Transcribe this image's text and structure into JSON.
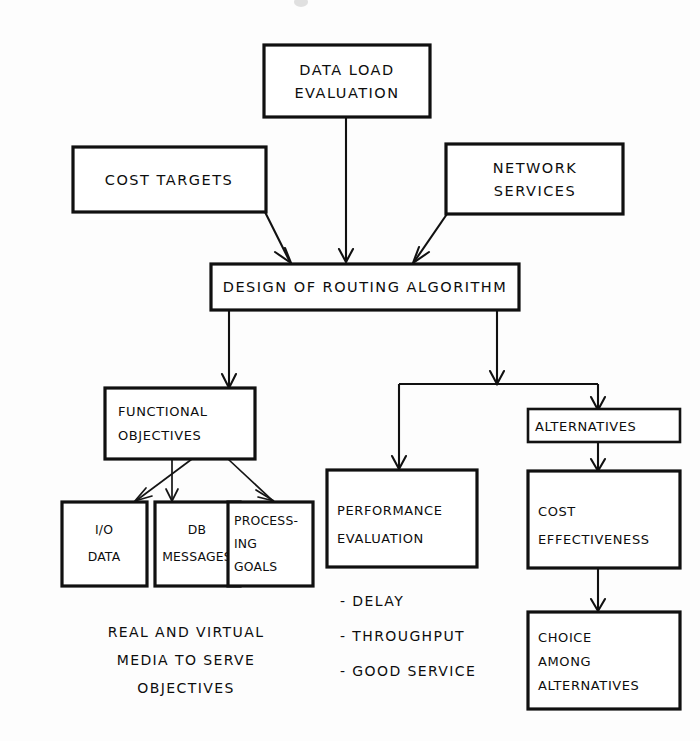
{
  "diagram": {
    "background_color": "#fdfdfd",
    "line_color": "#111111",
    "text_color": "#0d0d0d",
    "nodes": {
      "data_load_evaluation": {
        "line1": "DATA  LOAD",
        "line2": "EVALUATION"
      },
      "cost_targets": {
        "line1": "COST  TARGETS"
      },
      "network_services": {
        "line1": "NETWORK",
        "line2": "SERVICES"
      },
      "design_of_routing_algorithm": {
        "line1": "DESIGN  OF  ROUTING  ALGORITHM"
      },
      "functional_objectives": {
        "line1": "FUNCTIONAL",
        "line2": "OBJECTIVES"
      },
      "io_data": {
        "line1": "I/O",
        "line2": "DATA"
      },
      "db_messages": {
        "line1": "DB",
        "line2": "MESSAGES"
      },
      "processing_goals": {
        "line1": "PROCESS-",
        "line2": "ING",
        "line3": "GOALS"
      },
      "performance_evaluation": {
        "line1": "PERFORMANCE",
        "line2": "EVALUATION"
      },
      "alternatives": {
        "line1": "ALTERNATIVES"
      },
      "cost_effectiveness": {
        "line1": "COST",
        "line2": "EFFECTIVENESS"
      },
      "choice_among_alternatives": {
        "line1": "CHOICE",
        "line2": "AMONG",
        "line3": "ALTERNATIVES"
      }
    },
    "captions": {
      "media_note": {
        "line1": "REAL  AND  VIRTUAL",
        "line2": "MEDIA  TO  SERVE",
        "line3": "OBJECTIVES"
      }
    },
    "bullet_list": {
      "items": [
        "-  DELAY",
        "-  THROUGHPUT",
        "-  GOOD  SERVICE"
      ]
    }
  }
}
